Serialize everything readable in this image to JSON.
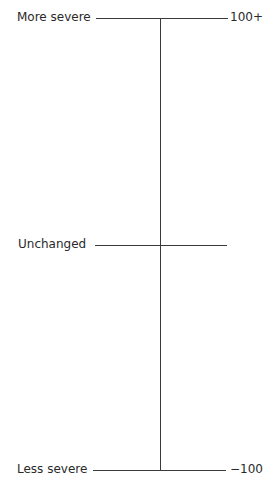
{
  "scale": {
    "top": {
      "label": "More severe",
      "value": "100+"
    },
    "middle": {
      "label": "Unchanged"
    },
    "bottom": {
      "label": "Less severe",
      "value": "−100"
    }
  }
}
